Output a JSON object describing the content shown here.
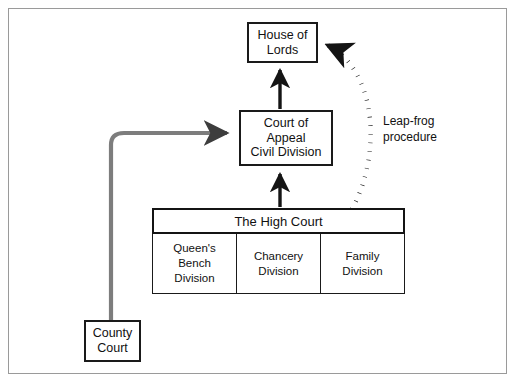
{
  "diagram": {
    "colors": {
      "frame": "#9a9a9a",
      "box_border": "#1a1a1a",
      "solid_arrow": "#141414",
      "county_route": "#7d7d7d",
      "dotted_arrow": "#141414",
      "background": "#ffffff"
    }
  },
  "nodes": {
    "house_of_lords": {
      "line1": "House of",
      "line2": "Lords"
    },
    "court_of_appeal": {
      "line1": "Court of",
      "line2": "Appeal",
      "line3": "Civil Division"
    },
    "county_court": {
      "line1": "County",
      "line2": "Court"
    }
  },
  "high_court": {
    "header": "The High Court",
    "divisions": [
      {
        "line1": "Queen's",
        "line2": "Bench",
        "line3": "Division"
      },
      {
        "line1": "Chancery",
        "line2": "Division",
        "line3": ""
      },
      {
        "line1": "Family",
        "line2": "Division",
        "line3": ""
      }
    ]
  },
  "annotations": {
    "leapfrog": {
      "line1": "Leap-frog",
      "line2": "procedure"
    }
  }
}
